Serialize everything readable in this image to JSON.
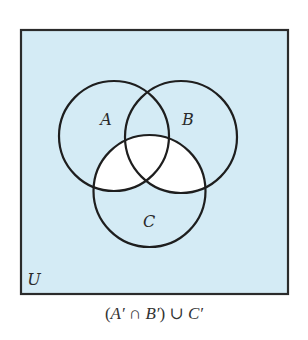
{
  "diagram": {
    "type": "venn",
    "universe": {
      "label": "U",
      "x": 21,
      "y": 30,
      "width": 267,
      "height": 264,
      "fill": "#d4ebf5",
      "stroke": "#2b2b2b"
    },
    "sets": [
      {
        "label": "A",
        "cx": 114,
        "cy": 136,
        "r": 55,
        "label_x": 106,
        "label_y": 125
      },
      {
        "label": "B",
        "cx": 181,
        "cy": 137,
        "r": 56,
        "label_x": 188,
        "label_y": 125
      },
      {
        "label": "C",
        "cx": 149.5,
        "cy": 191,
        "r": 56,
        "label_x": 149,
        "label_y": 227
      }
    ],
    "shaded_region": "(A′ ∩ B′) ∪ C′",
    "unshaded_region": "C ∩ (A ∪ B)",
    "unshaded_fill": "#ffffff",
    "circle_stroke": "#1e1e1e"
  },
  "labels": {
    "a": "A",
    "b": "B",
    "c": "C",
    "u": "U"
  },
  "caption": {
    "open_paren": "(",
    "a_prime": "A′",
    "intersect": " ∩ ",
    "b_prime": "B′",
    "close_paren": ")",
    "union": " ∪ ",
    "c_prime": "C′",
    "full_text": "(A′ ∩ B′) ∪ C′"
  }
}
